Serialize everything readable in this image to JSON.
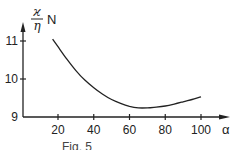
{
  "chart_data": {
    "type": "line",
    "title": "",
    "xlabel": "α",
    "ylabel": "ϰ/η N",
    "ylabel_numerator": "ϰ",
    "ylabel_denominator": "η",
    "ylabel_suffix": "N",
    "xlim": [
      0,
      110
    ],
    "ylim": [
      9,
      11.3
    ],
    "x_ticks": [
      20,
      40,
      60,
      80,
      100
    ],
    "x_tick_labels": [
      "20",
      "40",
      "60",
      "80",
      "100"
    ],
    "y_ticks": [
      9,
      10,
      11
    ],
    "y_tick_labels": [
      "9",
      "10",
      "11"
    ],
    "grid": false,
    "legend": null,
    "series": [
      {
        "name": "curve",
        "x": [
          17,
          20,
          25,
          30,
          35,
          40,
          45,
          50,
          55,
          60,
          65,
          70,
          75,
          80,
          85,
          90,
          95,
          100
        ],
        "y": [
          11.05,
          10.85,
          10.52,
          10.22,
          9.97,
          9.77,
          9.6,
          9.46,
          9.36,
          9.28,
          9.24,
          9.24,
          9.26,
          9.29,
          9.34,
          9.4,
          9.46,
          9.53
        ]
      }
    ],
    "caption": "Fig. 5"
  }
}
